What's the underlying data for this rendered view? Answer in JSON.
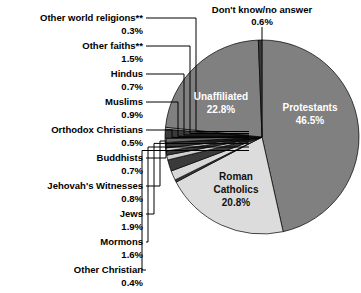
{
  "chart_data": {
    "type": "pie",
    "title": "",
    "subtitle": "",
    "legend_position": "external-callouts",
    "total": 100.0,
    "start_angle_deg": 0,
    "direction": "clockwise",
    "categories": [
      "Protestants",
      "Roman Catholics",
      "Other Christian",
      "Mormons",
      "Jews",
      "Jehovah's Witnesses",
      "Buddhists",
      "Orthodox Christians",
      "Muslims",
      "Hindus",
      "Other faiths**",
      "Other world religions**",
      "Unaffiliated",
      "Don't know/no answer"
    ],
    "values": [
      46.5,
      20.8,
      0.4,
      1.6,
      1.9,
      0.8,
      0.7,
      0.5,
      0.9,
      0.7,
      1.5,
      0.3,
      22.8,
      0.6
    ],
    "value_labels": [
      "46.5%",
      "20.8%",
      "0.4%",
      "1.6%",
      "1.9%",
      "0.8%",
      "0.7%",
      "0.5%",
      "0.9%",
      "0.7%",
      "1.5%",
      "0.3%",
      "22.8%",
      "0.6%"
    ],
    "colors": [
      "#808080",
      "#dcdcdc",
      "#3a3a3a",
      "#d8d8d8",
      "#3a3a3a",
      "#d0d0d0",
      "#3a3a3a",
      "#cfcfcf",
      "#3a3a3a",
      "#d4d4d4",
      "#3a3a3a",
      "#d0d0d0",
      "#808080",
      "#3a3a3a"
    ],
    "xlabel": "",
    "ylabel": ""
  },
  "pie": {
    "inside_labels": [
      {
        "name": "Protestants",
        "pct": "46.5%"
      },
      {
        "name": "Unaffiliated",
        "pct": "22.8%"
      },
      {
        "name": "Roman",
        "pct": ""
      },
      {
        "name": "Catholics",
        "pct": "20.8%"
      }
    ],
    "protestants_name": "Protestants",
    "protestants_pct": "46.5%",
    "unaffiliated_name": "Unaffiliated",
    "unaffiliated_pct": "22.8%",
    "catholics_name_1": "Roman",
    "catholics_name_2": "Catholics",
    "catholics_pct": "20.8%"
  },
  "top_callout": {
    "name": "Don't know/no answer",
    "pct": "0.6%"
  },
  "left_callouts": [
    {
      "name": "Other world religions**",
      "pct": "0.3%"
    },
    {
      "name": "Other faiths**",
      "pct": "1.5%"
    },
    {
      "name": "Hindus",
      "pct": "0.7%"
    },
    {
      "name": "Muslims",
      "pct": "0.9%"
    },
    {
      "name": "Orthodox Christians",
      "pct": "0.5%"
    },
    {
      "name": "Buddhists",
      "pct": "0.7%"
    },
    {
      "name": "Jehovah's Witnesses",
      "pct": "0.8%"
    },
    {
      "name": "Jews",
      "pct": "1.9%"
    },
    {
      "name": "Mormons",
      "pct": "1.6%"
    },
    {
      "name": "Other Christian",
      "pct": "0.4%"
    }
  ]
}
